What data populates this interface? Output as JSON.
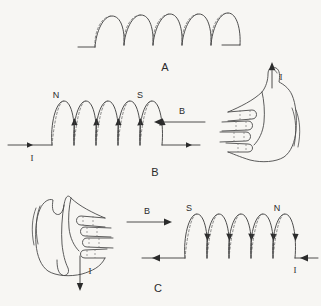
{
  "figure": {
    "background_color": "#f7f6f3",
    "line_color": "#3a3a3a",
    "panels": [
      {
        "id": "A",
        "label": "A",
        "description": "Plain helical solenoid coil with no labels",
        "coil_turns": 5,
        "labels": []
      },
      {
        "id": "B",
        "label": "B",
        "description": "Right hand, fingers pointing left along current, thumb up; solenoid with north pole at left",
        "coil_turns": 5,
        "left_pole": "N",
        "right_pole": "S",
        "field_label": "B",
        "field_direction": "left",
        "current_label": "I",
        "current_direction": "right",
        "thumb_label": "I",
        "thumb_direction": "up"
      },
      {
        "id": "C",
        "label": "C",
        "description": "Left-facing hand, fingers pointing right along field, thumb down; solenoid with south pole at left",
        "coil_turns": 5,
        "left_pole": "S",
        "right_pole": "N",
        "field_label": "B",
        "field_direction": "right",
        "current_label": "I",
        "current_direction": "left",
        "thumb_label": "I",
        "thumb_direction": "down"
      }
    ]
  }
}
